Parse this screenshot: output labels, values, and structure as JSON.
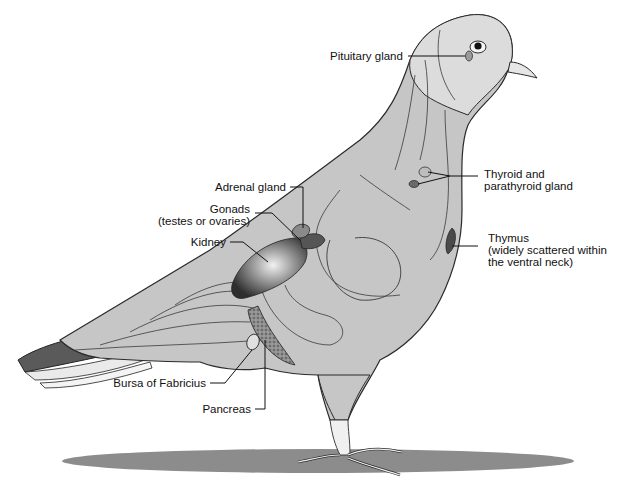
{
  "diagram": {
    "colors": {
      "body_fill": "#c6c6c6",
      "body_stroke": "#2a2a2a",
      "head_fill": "#dcdcdc",
      "gland_dark": "#4a4a4a",
      "gland_mid": "#8a8a8a",
      "shadow": "#8c8c8c",
      "background": "#ffffff"
    },
    "labels": [
      {
        "id": "pituitary",
        "lines": [
          "Pituitary gland"
        ]
      },
      {
        "id": "thyroid",
        "lines": [
          "Thyroid and",
          "parathyroid gland"
        ]
      },
      {
        "id": "thymus",
        "lines": [
          "Thymus",
          "(widely scattered within",
          "the ventral neck)"
        ]
      },
      {
        "id": "adrenal",
        "lines": [
          "Adrenal gland"
        ]
      },
      {
        "id": "gonads",
        "lines": [
          "Gonads",
          "(testes or ovaries)"
        ]
      },
      {
        "id": "kidney",
        "lines": [
          "Kidney"
        ]
      },
      {
        "id": "bursa",
        "lines": [
          "Bursa of Fabricius"
        ]
      },
      {
        "id": "pancreas",
        "lines": [
          "Pancreas"
        ]
      }
    ]
  }
}
